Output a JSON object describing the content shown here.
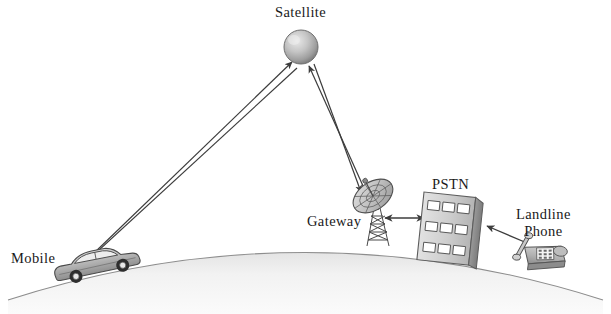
{
  "figure": {
    "background_color": "#ffffff",
    "line_color": "#3c3c3c",
    "label_color": "#1a1a1a",
    "earth_fill_color": "#f0f0f0",
    "earth_edge_color": "#8a8a8a"
  },
  "labels": {
    "satellite": "Satellite",
    "gateway": "Gateway",
    "pstn": "PSTN",
    "mobile": "Mobile",
    "landline_line1": "Landline",
    "landline_line2": "Phone"
  },
  "nodes": [
    {
      "id": "satellite",
      "label": "Satellite",
      "icon": "satellite-sphere-icon",
      "x": 300,
      "y": 48
    },
    {
      "id": "gateway",
      "label": "Gateway",
      "icon": "dish-antenna-icon",
      "x": 378,
      "y": 205
    },
    {
      "id": "pstn",
      "label": "PSTN",
      "icon": "pstn-building-icon",
      "x": 453,
      "y": 222
    },
    {
      "id": "landline",
      "label": "Landline Phone",
      "icon": "desk-phone-icon",
      "x": 538,
      "y": 258
    },
    {
      "id": "mobile",
      "label": "Mobile",
      "icon": "car-icon",
      "x": 76,
      "y": 268
    }
  ],
  "links": [
    {
      "from": "mobile",
      "to": "satellite",
      "direction": "uplink",
      "arrow": "to-satellite"
    },
    {
      "from": "satellite",
      "to": "mobile",
      "direction": "downlink",
      "arrow": "to-mobile"
    },
    {
      "from": "gateway",
      "to": "satellite",
      "direction": "uplink",
      "arrow": "to-satellite"
    },
    {
      "from": "satellite",
      "to": "gateway",
      "direction": "downlink",
      "arrow": "to-gateway"
    },
    {
      "from": "gateway",
      "to": "pstn",
      "direction": "bidirectional",
      "arrow": "double"
    },
    {
      "from": "landline",
      "to": "pstn",
      "direction": "to-pstn",
      "arrow": "to-pstn"
    }
  ],
  "pstn_building": {
    "window_rows": 3,
    "window_columns": 3,
    "window_count": 9
  }
}
